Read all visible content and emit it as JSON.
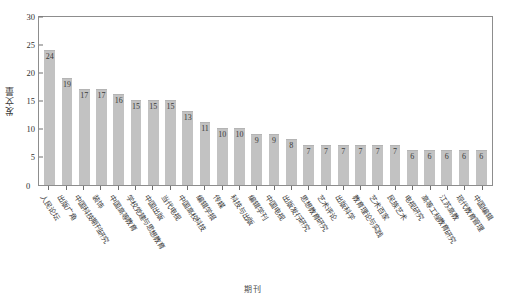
{
  "figure": {
    "top_caption_fragment": "",
    "background_color": "#ffffff",
    "bar_color": "#c2c2c2",
    "axis_color": "#8d8d8d",
    "text_color": "#3a3a3a"
  },
  "axes": {
    "y_title": "发文量",
    "x_title": "期刊",
    "y_ticks": [
      "30",
      "25",
      "20",
      "15",
      "10",
      "5"
    ],
    "y_zero_label": "0"
  },
  "chart_data": {
    "type": "bar",
    "title": "",
    "xlabel": "期刊",
    "ylabel": "发文量",
    "ylim": [
      0,
      30
    ],
    "ytick_values": [
      0,
      5,
      10,
      15,
      20,
      25,
      30
    ],
    "grid": false,
    "legend": null,
    "categories": [
      "人民论坛",
      "出版广角",
      "中国科技期刊研究",
      "装饰",
      "中国高等教育",
      "学校党建与思想教育",
      "中国出版",
      "当代电视",
      "中国高校科技",
      "编辑学报",
      "传媒",
      "科技与出版",
      "编辑学刊",
      "中国电视",
      "出版发行研究",
      "思想教育研究",
      "艺术评论",
      "出版科学",
      "教育理论与实践",
      "艺术百家",
      "民族艺术",
      "电视研究",
      "高等工程教育研究",
      "江苏高教",
      "现代教育管理",
      "中国编辑"
    ],
    "values": [
      24,
      19,
      17,
      17,
      16,
      15,
      15,
      15,
      13,
      11,
      10,
      10,
      9,
      9,
      8,
      7,
      7,
      7,
      7,
      7,
      7,
      6,
      6,
      6,
      6,
      6
    ],
    "data_labels": [
      "24",
      "19",
      "17",
      "17",
      "16",
      "15",
      "15",
      "15",
      "13",
      "11",
      "10",
      "10",
      "9",
      "9",
      "8",
      "7",
      "7",
      "7",
      "7",
      "7",
      "7",
      "6",
      "6",
      "6",
      "6",
      "6"
    ]
  }
}
